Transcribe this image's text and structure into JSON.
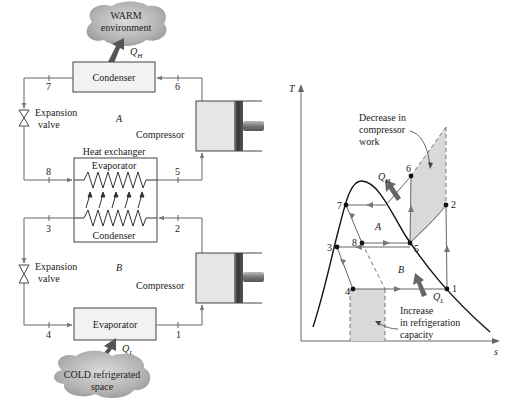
{
  "schematic": {
    "warm_cloud": {
      "line1": "WARM",
      "line2": "environment"
    },
    "cold_cloud": {
      "line1": "COLD refrigerated",
      "line2": "space"
    },
    "heat_labels": {
      "q_high": "Q",
      "q_high_sub": "H",
      "q_low": "Q",
      "q_low_sub": "L"
    },
    "condenser_top": "Condenser",
    "heat_exchanger": {
      "title": "Heat exchanger",
      "evaporator": "Evaporator",
      "condenser": "Condenser"
    },
    "evaporator_bottom": "Evaporator",
    "expansion_valve_upper": {
      "line1": "Expansion",
      "line2": "valve"
    },
    "expansion_valve_lower": {
      "line1": "Expansion",
      "line2": "valve"
    },
    "compressor_upper": "Compressor",
    "compressor_lower": "Compressor",
    "cycle_labels": {
      "top": "A",
      "bottom": "B"
    },
    "state_points": {
      "p1": "1",
      "p2": "2",
      "p3": "3",
      "p4": "4",
      "p5": "5",
      "p6": "6",
      "p7": "7",
      "p8": "8"
    }
  },
  "ts_diagram": {
    "axis_y": "T",
    "axis_x": "s",
    "annotation_top": {
      "line1": "Decrease in",
      "line2": "compressor",
      "line3": "work"
    },
    "annotation_bottom": {
      "line1": "Increase",
      "line2": "in refrigeration",
      "line3": "capacity"
    },
    "region_labels": {
      "upper": "A",
      "lower": "B"
    },
    "heat_labels": {
      "q_high": "Q",
      "q_high_sub": "H",
      "q_low": "Q",
      "q_low_sub": "L"
    },
    "state_points": {
      "p1": "1",
      "p2": "2",
      "p3": "3",
      "p4": "4",
      "p5": "5",
      "p6": "6",
      "p7": "7",
      "p8": "8"
    }
  },
  "colors": {
    "line": "#555555",
    "curve": "#111111",
    "shade": "#d9d9d9",
    "arrow": "#6a6a6a",
    "cloud": "#a8a8a8",
    "box_fill": "#f2f2f2"
  }
}
